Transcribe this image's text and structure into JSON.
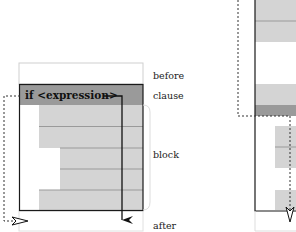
{
  "left_figure": {
    "clause_text": "if <expression>",
    "labels": {
      "before": "before",
      "clause": "clause",
      "block": "block",
      "after": "after"
    }
  },
  "colors": {
    "clause_fill": "#9a9a9a",
    "block_fill": "#d4d4d4",
    "frame": "#1a1a1a",
    "light_frame": "#cccccc"
  }
}
